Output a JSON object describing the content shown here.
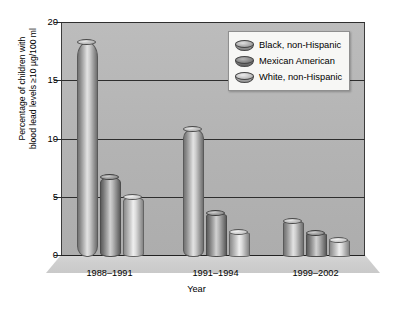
{
  "chart_data": {
    "type": "bar",
    "title": "",
    "xlabel": "Year",
    "ylabel": "Percentage of children with blood lead levels ≥10 µg/100 ml",
    "ylabel_line1": "Percentage of children with",
    "ylabel_line2": "blood lead levels ≥10 µg/100 ml",
    "categories": [
      "1988–1991",
      "1991–1994",
      "1999–2002"
    ],
    "series": [
      {
        "name": "Black, non-Hispanic",
        "values": [
          18.3,
          10.8,
          2.9
        ]
      },
      {
        "name": "Mexican American",
        "values": [
          6.7,
          3.6,
          1.9
        ]
      },
      {
        "name": "White, non-Hispanic",
        "values": [
          5.0,
          2.0,
          1.3
        ]
      }
    ],
    "ylim": [
      0,
      20
    ],
    "yticks": [
      0,
      5,
      10,
      15,
      20
    ],
    "ytick_labels": [
      "0",
      "5",
      "10",
      "15",
      "20"
    ],
    "grid": true,
    "legend_position": "top-right",
    "colors": {
      "panel": "#b5b5b5",
      "gridline": "#2e2e2e",
      "axis": "#3c3c3c",
      "page": "#ffffff",
      "legend_background": "#f7f7f5"
    }
  },
  "legend": {
    "entries": [
      {
        "label": "Black, non-Hispanic",
        "swatch": "cylinder-swatch-dark"
      },
      {
        "label": "Mexican American",
        "swatch": "cylinder-swatch-darker"
      },
      {
        "label": "White, non-Hispanic",
        "swatch": "cylinder-swatch-light"
      }
    ]
  }
}
